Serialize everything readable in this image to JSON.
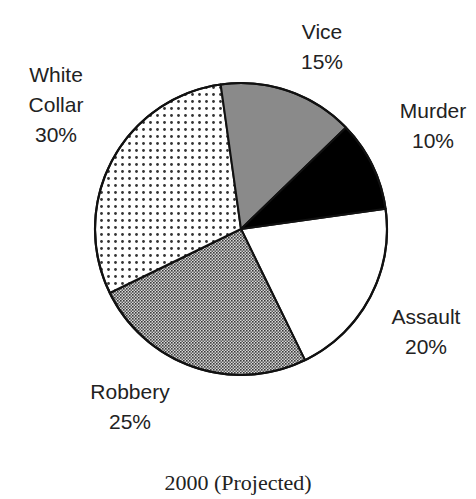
{
  "chart_data": {
    "type": "pie",
    "title": "2000 (Projected)",
    "categories": [
      "Assault",
      "Robbery",
      "White Collar",
      "Vice",
      "Murder"
    ],
    "values": [
      20,
      25,
      30,
      15,
      10
    ],
    "unit": "%",
    "start_angle_deg": -8,
    "direction": "clockwise",
    "slices": [
      {
        "label": "Assault",
        "value": 20,
        "value_label": "20%",
        "fill": "#ffffff",
        "pattern": "solid-white"
      },
      {
        "label": "Robbery",
        "value": 25,
        "value_label": "25%",
        "fill": "#5a5a5a",
        "pattern": "fine-checker"
      },
      {
        "label": "White Collar",
        "value": 30,
        "value_label": "30%",
        "fill": "#ffffff",
        "pattern": "sparse-dots"
      },
      {
        "label": "Vice",
        "value": 15,
        "value_label": "15%",
        "fill": "#8a8a8a",
        "pattern": "solid-gray"
      },
      {
        "label": "Murder",
        "value": 10,
        "value_label": "10%",
        "fill": "#000000",
        "pattern": "solid-black"
      }
    ],
    "legend": "none (labels placed beside slices)"
  },
  "labels": {
    "vice": {
      "name": "Vice",
      "pct": "15%"
    },
    "murder": {
      "name": "Murder",
      "pct": "10%"
    },
    "white_collar": {
      "name_line1": "White",
      "name_line2": "Collar",
      "pct": "30%"
    },
    "assault": {
      "name": "Assault",
      "pct": "20%"
    },
    "robbery": {
      "name": "Robbery",
      "pct": "25%"
    }
  },
  "caption": "2000 (Projected)",
  "colors": {
    "outline": "#111111",
    "text": "#222222",
    "vice_gray": "#8a8a8a",
    "murder_black": "#000000",
    "checker_dark": "#3a3a3a",
    "dot": "#333333"
  }
}
